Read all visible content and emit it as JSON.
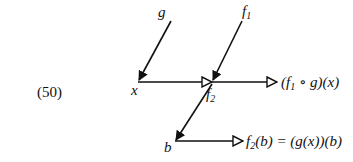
{
  "equation_number": "(50)",
  "nodes": {
    "g": "g",
    "f1": {
      "base": "f",
      "sub": "1"
    },
    "x": "x",
    "f2": {
      "base": "f",
      "sub": "2"
    },
    "b": "b"
  },
  "outputs": {
    "top": {
      "parts": [
        "(",
        "f",
        "1",
        " ∘ g)(x)"
      ]
    },
    "bottom": {
      "parts": [
        "f",
        "2",
        "(b) = (g(x))(b)"
      ]
    }
  },
  "edges": [
    {
      "from": "g",
      "to": "x",
      "head": "filled"
    },
    {
      "from": "f1",
      "to": "f2",
      "head": "filled"
    },
    {
      "from": "x",
      "to": "f2",
      "head": "hollow"
    },
    {
      "from": "f2",
      "to": "top-output",
      "head": "hollow"
    },
    {
      "from": "f2",
      "to": "b",
      "head": "filled"
    },
    {
      "from": "b",
      "to": "bottom-output",
      "head": "hollow"
    }
  ]
}
